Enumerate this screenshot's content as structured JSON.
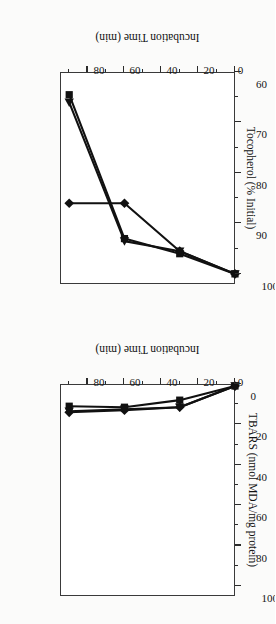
{
  "figure": {
    "background": "#fbfbfa",
    "ink": "#141414",
    "orientation": "rotated-180",
    "panel_count": 2
  },
  "panels": {
    "top": {
      "name": "tocopherol-panel",
      "ylabel": "Tocopherol (% Initial)",
      "xlabel": "Incubation Time (min)",
      "yticks": [
        "100",
        "90",
        "80",
        "70",
        "60"
      ],
      "xticks": [
        "0",
        "20",
        "40",
        "60",
        "80"
      ]
    },
    "bottom": {
      "name": "tbars-panel",
      "ylabel": "TBARS (nmol MDA/mg protein)",
      "xlabel": "Incubation Time (min)",
      "yticks": [
        "0",
        "20",
        "40",
        "60",
        "80",
        "100"
      ],
      "xticks": [
        "0",
        "20",
        "40",
        "60",
        "80"
      ]
    }
  },
  "chart_data": [
    {
      "type": "line",
      "id": "tocopherol",
      "title": "",
      "xlabel": "Incubation Time (min)",
      "ylabel": "Tocopherol (% Initial)",
      "xlim": [
        0,
        95
      ],
      "ylim": [
        60,
        102
      ],
      "xticks": [
        0,
        20,
        40,
        60,
        80
      ],
      "yticks": [
        60,
        70,
        80,
        90,
        100
      ],
      "minor_xticks": [
        10,
        30,
        50,
        70,
        90
      ],
      "minor_yticks": [
        65,
        75,
        85,
        95
      ],
      "grid": false,
      "legend": "none",
      "x": [
        0,
        30,
        60,
        90
      ],
      "series": [
        {
          "name": "series-diamond",
          "marker": "diamond",
          "values": [
            100,
            95.5,
            86,
            86
          ]
        },
        {
          "name": "series-square",
          "marker": "square",
          "values": [
            100,
            96,
            93,
            64.5
          ]
        },
        {
          "name": "series-triangle",
          "marker": "triangle",
          "values": [
            100,
            95.5,
            93.5,
            66
          ]
        }
      ]
    },
    {
      "type": "line",
      "id": "tbars",
      "title": "",
      "xlabel": "Incubation Time (min)",
      "ylabel": "TBARS (nmol MDA/mg protein)",
      "xlim": [
        0,
        95
      ],
      "ylim": [
        0,
        105
      ],
      "xticks": [
        0,
        20,
        40,
        60,
        80
      ],
      "yticks": [
        0,
        20,
        40,
        60,
        80,
        100
      ],
      "minor_xticks": [
        10,
        30,
        50,
        70,
        90
      ],
      "minor_yticks": [
        10,
        30,
        50,
        70,
        90
      ],
      "grid": false,
      "legend": "none",
      "x": [
        0,
        30,
        60,
        90
      ],
      "series": [
        {
          "name": "series-diamond",
          "marker": "diamond",
          "values": [
            1,
            11.5,
            13,
            14
          ]
        },
        {
          "name": "series-square",
          "marker": "square",
          "values": [
            1,
            8,
            11.5,
            11
          ]
        },
        {
          "name": "series-triangle",
          "marker": "triangle",
          "values": [
            1,
            11.5,
            12.5,
            13.5
          ]
        }
      ]
    }
  ]
}
